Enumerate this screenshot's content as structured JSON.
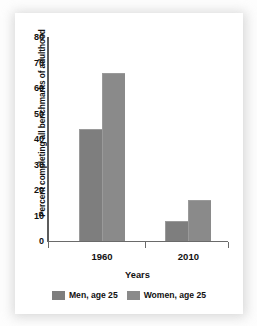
{
  "chart_data": {
    "type": "bar",
    "title": "",
    "xlabel": "Years",
    "ylabel": "Percent completing all benchmarks of adulthood",
    "categories": [
      "1960",
      "2010"
    ],
    "series": [
      {
        "name": "Men, age 25",
        "values": [
          44,
          8
        ],
        "color": "#7e7e7e"
      },
      {
        "name": "Women, age 25",
        "values": [
          66,
          16
        ],
        "color": "#8a8a8a"
      }
    ],
    "ylim": [
      0,
      80
    ],
    "yticks": [
      0,
      10,
      20,
      30,
      40,
      50,
      60,
      70,
      80
    ],
    "ytick_labels": [
      "0",
      "10",
      "20",
      "30",
      "40",
      "50",
      "60",
      "70",
      "80"
    ],
    "grid": false,
    "legend_position": "bottom"
  },
  "legend": {
    "entries": [
      {
        "label": "Men, age 25"
      },
      {
        "label": "Women, age 25"
      }
    ]
  }
}
